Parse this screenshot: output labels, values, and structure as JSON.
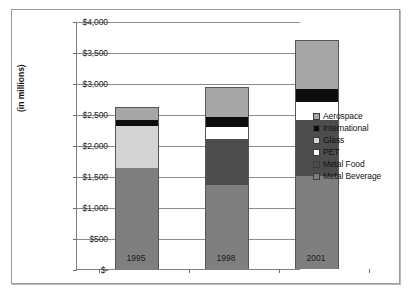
{
  "chart_data": {
    "type": "bar",
    "subtype": "stacked-bar",
    "title": "",
    "xlabel": "",
    "ylabel": "(in millions)",
    "categories": [
      "1995",
      "1998",
      "2001"
    ],
    "ylim": [
      0,
      4000
    ],
    "ytick_step": 500,
    "ytick_labels": [
      "$4,000",
      "$3,500",
      "$3,000",
      "$2,500",
      "$2,000",
      "$1,500",
      "$1,000",
      "$500",
      "$-"
    ],
    "ytick_values": [
      4000,
      3500,
      3000,
      2500,
      2000,
      1500,
      1000,
      500,
      0
    ],
    "grid": true,
    "legend_position": "right",
    "currency_prefix": "$",
    "series": [
      {
        "name": "Metal Beverage",
        "color": "#7f7f7f",
        "values": [
          1630,
          1360,
          1500
        ]
      },
      {
        "name": "Metal Food",
        "color": "#4d4d4d",
        "values": [
          0,
          740,
          900
        ]
      },
      {
        "name": "PET",
        "color": "#ffffff",
        "values": [
          0,
          190,
          300
        ]
      },
      {
        "name": "Glass",
        "color": "#d4d4d4",
        "values": [
          680,
          0,
          0
        ]
      },
      {
        "name": "International",
        "color": "#0d0d0d",
        "values": [
          100,
          160,
          200
        ]
      },
      {
        "name": "Aerospace",
        "color": "#a6a6a6",
        "values": [
          210,
          480,
          800
        ]
      }
    ],
    "totals": [
      2620,
      2930,
      3700
    ],
    "legend_order": [
      "Aerospace",
      "International",
      "Glass",
      "PET",
      "Metal Food",
      "Metal Beverage"
    ]
  },
  "axis": {
    "y_title": "(in millions)"
  },
  "legend": {
    "items": [
      {
        "label": "Aerospace",
        "color": "#a6a6a6"
      },
      {
        "label": "International",
        "color": "#0d0d0d"
      },
      {
        "label": "Glass",
        "color": "#d4d4d4"
      },
      {
        "label": "PET",
        "color": "#ffffff"
      },
      {
        "label": "Metal Food",
        "color": "#4d4d4d"
      },
      {
        "label": "Metal Beverage",
        "color": "#7f7f7f"
      }
    ]
  }
}
